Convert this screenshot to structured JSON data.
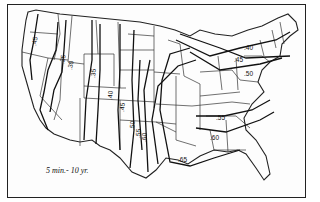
{
  "map": {
    "caption": "5 min.- 10 yr.",
    "subject": "Rainfall intensity isopluvials, United States",
    "colors": {
      "background": "#ffffff",
      "lines": "#111111"
    },
    "isolines": [
      {
        "label": ".45",
        "region": "Pacific Northwest coast"
      },
      {
        "label": ".25",
        "region": "Nevada/Idaho"
      },
      {
        "label": ".30",
        "region": "Idaho/Utah"
      },
      {
        "label": ".35",
        "region": "Wyoming/Colorado"
      },
      {
        "label": ".40",
        "region": "Colorado/New Mexico"
      },
      {
        "label": ".45",
        "region": "Eastern Colorado/New Mexico"
      },
      {
        "label": ".50",
        "region": "Western Texas"
      },
      {
        "label": ".55",
        "region": "Central Texas"
      },
      {
        "label": ".60",
        "region": "Central Texas"
      },
      {
        "label": ".40",
        "region": "Northern Great Lakes / New England"
      },
      {
        "label": ".45",
        "region": "Great Lakes / New York"
      },
      {
        "label": ".50",
        "region": "Ohio Valley / Mid-Atlantic"
      },
      {
        "label": ".55",
        "region": "Tennessee / Virginia"
      },
      {
        "label": ".60",
        "region": "Georgia / South Carolina"
      },
      {
        "label": ".65",
        "region": "Gulf Coast"
      }
    ]
  }
}
